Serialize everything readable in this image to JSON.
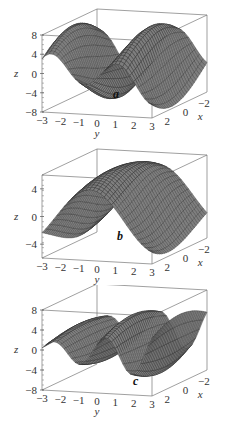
{
  "figure": {
    "top_cut_text": "…",
    "panels": [
      {
        "id": "a",
        "label": "a",
        "zticks": [
          "8",
          "4",
          "0",
          "-4",
          "-8"
        ],
        "zrange": [
          -8,
          8
        ],
        "func": "a",
        "top": 0,
        "height": 145
      },
      {
        "id": "b",
        "label": "b",
        "zticks": [
          "4",
          "0",
          "-4"
        ],
        "zrange": [
          -6,
          6
        ],
        "func": "b",
        "top": 145,
        "height": 140
      },
      {
        "id": "c",
        "label": "c",
        "zticks": [
          "8",
          "4",
          "0",
          "-4",
          "-8"
        ],
        "zrange": [
          -8,
          8
        ],
        "func": "c",
        "top": 285,
        "height": 151
      }
    ],
    "yticks": [
      "-3",
      "-2",
      "-1",
      "0",
      "1",
      "2",
      "3"
    ],
    "xticks": [
      "2",
      "0",
      "-2"
    ],
    "xlabel": "x",
    "ylabel": "y",
    "zlabel": "z"
  },
  "chart_data": [
    {
      "type": "surface",
      "title": "a",
      "xlabel": "x",
      "ylabel": "y",
      "zlabel": "z",
      "xrange": [
        -3,
        3
      ],
      "yrange": [
        -3,
        3
      ],
      "zlim": [
        -8,
        8
      ],
      "zticks": [
        8,
        4,
        0,
        -4,
        -8
      ],
      "yticks": [
        -3,
        -2,
        -1,
        0,
        1,
        2,
        3
      ],
      "xticks": [
        2,
        0,
        -2
      ],
      "description": "Wavy surface with two peaks (~6 near y=0, ~9 near y=1.5) and troughs (~-8 at y=-3, ~-7 at y=3)"
    },
    {
      "type": "surface",
      "title": "b",
      "xlabel": "x",
      "ylabel": "y",
      "zlabel": "z",
      "xrange": [
        -3,
        3
      ],
      "yrange": [
        -3,
        3
      ],
      "zlim": [
        -6,
        6
      ],
      "zticks": [
        4,
        0,
        -4
      ],
      "yticks": [
        -3,
        -2,
        -1,
        0,
        1,
        2,
        3
      ],
      "xticks": [
        2,
        0,
        -2
      ],
      "description": "Single ridge peak (~6) near y=0, troughs (~-5) at edges"
    },
    {
      "type": "surface",
      "title": "c",
      "xlabel": "x",
      "ylabel": "y",
      "zlabel": "z",
      "xrange": [
        -3,
        3
      ],
      "yrange": [
        -3,
        3
      ],
      "zlim": [
        -8,
        8
      ],
      "zticks": [
        8,
        4,
        0,
        -4,
        -8
      ],
      "yticks": [
        -3,
        -2,
        -1,
        0,
        1,
        2,
        3
      ],
      "xticks": [
        2,
        0,
        -2
      ],
      "description": "Higher-frequency oscillating surface with alternating peaks (~8) and troughs (~-8)"
    }
  ]
}
